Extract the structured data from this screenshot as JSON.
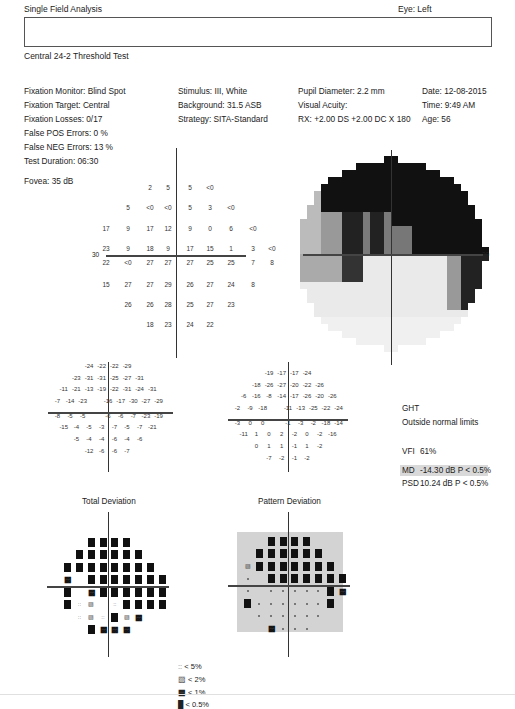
{
  "header": {
    "title": "Single Field Analysis",
    "eye": "Eye: Left",
    "test_name": "Central 24-2 Threshold Test"
  },
  "info": {
    "col1": [
      "Fixation Monitor: Blind Spot",
      "Fixation Target: Central",
      "Fixation Losses: 0/17",
      "False POS Errors:  0 %",
      "False NEG Errors:  13 %",
      "Test Duration: 06:30"
    ],
    "col2": [
      "Stimulus: III, White",
      "Background: 31.5 ASB",
      "Strategy: SITA-Standard"
    ],
    "col3": [
      "Pupil Diameter: 2.2 mm",
      "Visual Acuity:",
      "RX: +2.00 DS  +2.00 DC  X 180"
    ],
    "col4": [
      "Date: 12-08-2015",
      "Time: 9:49 AM",
      "Age: 56"
    ],
    "fovea": "Fovea: 35 dB"
  },
  "threshold_map": {
    "axis_label": "30",
    "rows": [
      [
        "",
        "",
        "",
        "2",
        "5",
        "5",
        "<0",
        "",
        "",
        ""
      ],
      [
        "",
        "",
        "5",
        "<0",
        "<0",
        "5",
        "3",
        "<0",
        "",
        ""
      ],
      [
        "",
        "17",
        "9",
        "17",
        "12",
        "9",
        "0",
        "6",
        "<0",
        ""
      ],
      [
        "",
        "23",
        "9",
        "18",
        "9",
        "17",
        "15",
        "1",
        "3",
        "<0"
      ],
      [
        "",
        "22",
        "<0",
        "27",
        "27",
        "27",
        "25",
        "25",
        "7",
        "8"
      ],
      [
        "",
        "15",
        "27",
        "27",
        "29",
        "26",
        "27",
        "24",
        "8",
        ""
      ],
      [
        "",
        "",
        "26",
        "26",
        "28",
        "25",
        "27",
        "23",
        "",
        ""
      ],
      [
        "",
        "",
        "",
        "18",
        "23",
        "24",
        "22",
        "",
        "",
        ""
      ]
    ]
  },
  "grayscale": {
    "axis_label": "30"
  },
  "total_deviation_values": {
    "rows": [
      [
        "",
        "",
        "-24",
        "-22",
        "-22",
        "-29",
        "",
        ""
      ],
      [
        "",
        "-23",
        "-31",
        "-31",
        "-25",
        "-27",
        "-31",
        ""
      ],
      [
        "-11",
        "-21",
        "-13",
        "-19",
        "-22",
        "-31",
        "-24",
        "-31"
      ],
      [
        "-7",
        "",
        "-14",
        "-23",
        "-16",
        "-17",
        "-30",
        "-27",
        "-29"
      ],
      [
        "-8",
        "",
        "-5",
        "-5",
        "-6",
        "-6",
        "-7",
        "-23",
        "-19"
      ],
      [
        "-15",
        "-4",
        "-5",
        "-3",
        "-7",
        "-5",
        "-7",
        "-21"
      ],
      [
        "",
        "-5",
        "-4",
        "-4",
        "-6",
        "-4",
        "-6",
        ""
      ],
      [
        "",
        "",
        "-12",
        "-6",
        "-6",
        "-7",
        "",
        ""
      ]
    ]
  },
  "pattern_deviation_values": {
    "rows": [
      [
        "",
        "",
        "-19",
        "-17",
        "-17",
        "-24",
        "",
        ""
      ],
      [
        "",
        "-18",
        "-26",
        "-27",
        "-20",
        "-22",
        "-26",
        ""
      ],
      [
        "-6",
        "-16",
        "-8",
        "-14",
        "-17",
        "-26",
        "-20",
        "-26"
      ],
      [
        "-2",
        "",
        "-9",
        "-18",
        "-11",
        "-13",
        "-25",
        "-22",
        "-24"
      ],
      [
        "-3",
        "",
        "0",
        "0",
        "-1",
        "-3",
        "-2",
        "-18",
        "-14"
      ],
      [
        "-11",
        "1",
        "0",
        "2",
        "-2",
        "0",
        "-2",
        "-16"
      ],
      [
        "",
        "0",
        "1",
        "1",
        "-1",
        "1",
        "-2",
        ""
      ],
      [
        "",
        "",
        "-7",
        "-2",
        "-1",
        "-2",
        "",
        ""
      ]
    ]
  },
  "summary": {
    "ght_label": "GHT",
    "ght_value": "Outside normal limits",
    "vfi_label": "VFI",
    "vfi_value": "61%",
    "md_label": "MD",
    "md_value": "-14.30 dB  P < 0.5%",
    "psd_label": "PSD",
    "psd_value": "10.24 dB  P < 0.5%"
  },
  "plots": {
    "total_deviation_title": "Total Deviation",
    "pattern_deviation_title": "Pattern Deviation"
  },
  "legend": [
    {
      "symbol": "p5",
      "label": "< 5%"
    },
    {
      "symbol": "p2",
      "label": "< 2%"
    },
    {
      "symbol": "p1",
      "label": "< 1%"
    },
    {
      "symbol": "p05",
      "label": "< 0.5%"
    }
  ],
  "colors": {
    "dark": "#111111",
    "mid_gray": "#888888",
    "panel_gray": "#d3d3d3"
  }
}
